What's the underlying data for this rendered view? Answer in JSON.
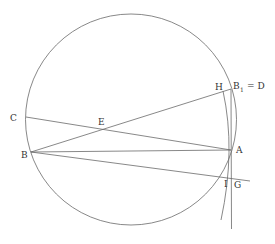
{
  "diagram": {
    "type": "geometry-construction",
    "colors": {
      "stroke": "#6a6a6a",
      "label": "#333333",
      "background": "#ffffff"
    },
    "circle": {
      "cx": 131,
      "cy": 119.5,
      "r": 105.5
    },
    "points": {
      "C": {
        "x": 26,
        "y": 117,
        "label": "C"
      },
      "B": {
        "x": 31,
        "y": 152,
        "label": "B"
      },
      "E": {
        "x": 101,
        "y": 129,
        "label": "E"
      },
      "A": {
        "x": 231,
        "y": 150,
        "label": "A"
      },
      "H": {
        "x": 223,
        "y": 91,
        "label": "H"
      },
      "B1": {
        "x": 231,
        "y": 89,
        "label": "B",
        "subscript": "1",
        "suffix": "= D"
      },
      "I": {
        "x": 229,
        "y": 178,
        "label": "I"
      },
      "G": {
        "x": 234,
        "y": 178,
        "label": "G"
      }
    },
    "labels": {
      "C": "C",
      "B": "B",
      "E": "E",
      "A": "A",
      "H": "H",
      "B1_main": "B",
      "B1_sub": "1",
      "B1_eq": "= D",
      "I": "I",
      "G": "G"
    }
  }
}
